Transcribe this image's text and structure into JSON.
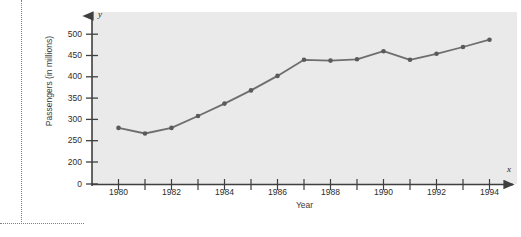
{
  "page": {
    "background": "#ffffff",
    "cut_text": "",
    "frame_color": "#808080"
  },
  "figure": {
    "plot_background": "#eaeaea",
    "axis_color": "#3f3f3f",
    "series_color": "#6e6e6e",
    "marker_color": "#5a5a5a",
    "y_axis_variable": "y",
    "x_axis_variable": "x"
  },
  "chart_data": {
    "type": "line",
    "title": "",
    "xlabel": "Year",
    "ylabel": "Passengers (in millions)",
    "x": [
      1980,
      1981,
      1982,
      1983,
      1984,
      1985,
      1986,
      1987,
      1988,
      1989,
      1990,
      1991,
      1992,
      1993,
      1994
    ],
    "values": [
      280,
      267,
      280,
      308,
      337,
      368,
      402,
      440,
      438,
      441,
      460,
      440,
      454,
      470,
      487
    ],
    "series": [
      {
        "name": "Passengers",
        "values": [
          280,
          267,
          280,
          308,
          337,
          368,
          402,
          440,
          438,
          441,
          460,
          440,
          454,
          470,
          487
        ]
      }
    ],
    "xlim": [
      1979.4,
      1994.9
    ],
    "ylim": [
      190,
      520
    ],
    "y_ticks": [
      200,
      250,
      300,
      350,
      400,
      450,
      500
    ],
    "y_tick_labels": [
      "200",
      "250",
      "300",
      "350",
      "400",
      "450",
      "500"
    ],
    "y_origin_label": "0",
    "y_axis_break": true,
    "x_ticks": [
      1980,
      1981,
      1982,
      1983,
      1984,
      1985,
      1986,
      1987,
      1988,
      1989,
      1990,
      1991,
      1992,
      1993,
      1994
    ],
    "x_tick_labels": [
      "1980",
      "",
      "1982",
      "",
      "1984",
      "",
      "1986",
      "",
      "1988",
      "",
      "1990",
      "",
      "1992",
      "",
      "1994"
    ],
    "grid": false,
    "legend": null,
    "markers": true,
    "arrow_axes": true
  }
}
